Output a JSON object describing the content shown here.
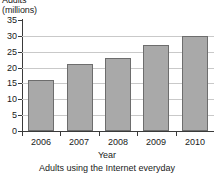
{
  "chart_data": {
    "type": "bar",
    "title": "",
    "caption": "Adults using the Internet everyday",
    "xlabel": "Year",
    "ylabel_lines": [
      "Adults",
      "(millions)"
    ],
    "categories": [
      "2006",
      "2007",
      "2008",
      "2009",
      "2010"
    ],
    "values": [
      16,
      21,
      23,
      27,
      30
    ],
    "ylim": [
      0,
      35
    ],
    "ytick_values": [
      0,
      5,
      10,
      15,
      20,
      25,
      30,
      35
    ],
    "ytick_labels": [
      "0",
      "5",
      "10",
      "15",
      "20",
      "25",
      "30",
      "35"
    ],
    "grid": true,
    "grid_axis": "y",
    "legend": "none",
    "series": [
      {
        "name": "Adults using the Internet everyday",
        "values": [
          16,
          21,
          23,
          27,
          30
        ]
      }
    ],
    "colors": {
      "bar_fill": "#a9a9a9",
      "bar_border": "#6d6d6d",
      "gridline": "#c9c9c9",
      "axis": "#3a3a3a",
      "text": "#1a1a1a",
      "background": "#ffffff"
    }
  }
}
